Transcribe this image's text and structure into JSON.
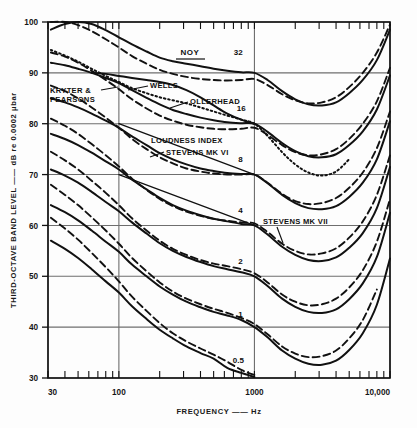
{
  "figure": {
    "background": "#fdfdfd",
    "ink": "#111111",
    "grid_color": "#6e6e6e"
  },
  "axis": {
    "y_title": "THIRD-OCTAVE BAND LEVEL —— dB re 0.0002 μbar",
    "x_title": "FREQUENCY —— Hz",
    "x_ticklabels": [
      "30",
      "100",
      "1000",
      "10,000"
    ],
    "y_ticklabels": [
      "30",
      "40",
      "50",
      "60",
      "70",
      "80",
      "90",
      "100"
    ]
  },
  "annotations": {
    "noy_header": "NOY",
    "kryter": "KRYTER &",
    "kryter2": "PEARSONS",
    "wells": "WELLS",
    "ollerhead": "OLLERHEAD",
    "loudness_index": "LOUDNESS INDEX",
    "stevens_mk6": "STEVENS MK VI",
    "stevens_mk7": "STEVENS MK VII"
  },
  "chart_data": {
    "type": "line",
    "title": "",
    "xlabel": "FREQUENCY — Hz",
    "ylabel": "THIRD-OCTAVE BAND LEVEL — dB re 0.0002 μbar",
    "xscale": "log",
    "xlim": [
      30,
      10000
    ],
    "ylim": [
      30,
      100
    ],
    "xticks": [
      30,
      100,
      1000,
      10000
    ],
    "yticks": [
      30,
      40,
      50,
      60,
      70,
      80,
      90,
      100
    ],
    "grid": true,
    "legend": "inline-annotations",
    "noy_contours": [
      32,
      16,
      8,
      4,
      2,
      1,
      0.5
    ],
    "noy_label_positions": [
      {
        "noy": "32",
        "x": 760,
        "y": 93.5
      },
      {
        "noy": "16",
        "x": 800,
        "y": 82.5
      },
      {
        "noy": "8",
        "x": 790,
        "y": 72.5
      },
      {
        "noy": "4",
        "x": 790,
        "y": 62.5
      },
      {
        "noy": "2",
        "x": 790,
        "y": 52.5
      },
      {
        "noy": "1",
        "x": 790,
        "y": 42.0
      },
      {
        "noy": "0.5",
        "x": 760,
        "y": 33.0
      }
    ],
    "series": [
      {
        "name": "Kryter & Pearsons (solid)",
        "style": "solid",
        "noy": 32,
        "x": [
          31.5,
          40,
          50,
          63,
          80,
          100,
          125,
          160,
          200,
          250,
          315,
          400,
          500,
          630,
          800,
          1000,
          1250,
          1600,
          2000,
          2500,
          3150,
          4000,
          5000,
          6300,
          8000,
          10000
        ],
        "y": [
          98.5,
          99.6,
          100,
          99.6,
          98.4,
          97.0,
          95.6,
          94.2,
          93.0,
          92.3,
          91.8,
          91.3,
          90.8,
          90.4,
          90.1,
          90.0,
          88.6,
          86.4,
          84.8,
          83.8,
          83.6,
          84.2,
          86.0,
          88.6,
          92.5,
          98.5
        ]
      },
      {
        "name": "Kryter & Pearsons (solid)",
        "style": "solid",
        "noy": 16,
        "x": [
          31.5,
          40,
          50,
          63,
          80,
          100,
          125,
          160,
          200,
          250,
          315,
          400,
          500,
          630,
          800,
          1000,
          1250,
          1600,
          2000,
          2500,
          3150,
          4000,
          5000,
          6300,
          8000,
          10000
        ],
        "y": [
          92.0,
          91.5,
          90.8,
          90.0,
          89.0,
          88.0,
          86.6,
          85.1,
          83.8,
          82.7,
          81.9,
          81.2,
          80.7,
          80.3,
          80.1,
          80.0,
          78.4,
          76.2,
          74.6,
          73.6,
          73.4,
          74.0,
          75.8,
          78.5,
          82.8,
          89.5
        ]
      },
      {
        "name": "Kryter & Pearsons (solid)",
        "style": "solid",
        "noy": 8,
        "x": [
          31.5,
          40,
          50,
          63,
          80,
          100,
          125,
          160,
          200,
          250,
          315,
          400,
          500,
          630,
          800,
          1000,
          1250,
          1600,
          2000,
          2500,
          3150,
          4000,
          5000,
          6300,
          8000,
          10000
        ],
        "y": [
          85.0,
          84.2,
          83.2,
          82.0,
          80.6,
          79.2,
          77.5,
          75.8,
          74.2,
          73.0,
          72.0,
          71.2,
          70.7,
          70.3,
          70.1,
          70.0,
          68.3,
          66.0,
          64.4,
          63.4,
          63.2,
          63.8,
          65.6,
          68.4,
          73.0,
          80.5
        ]
      },
      {
        "name": "Kryter & Pearsons (solid)",
        "style": "solid",
        "noy": 4,
        "x": [
          31.5,
          40,
          50,
          63,
          80,
          100,
          125,
          160,
          200,
          250,
          315,
          400,
          500,
          630,
          800,
          1000,
          1250,
          1600,
          2000,
          2500,
          3150,
          4000,
          5000,
          6300,
          8000,
          10000
        ],
        "y": [
          78.0,
          77.0,
          75.8,
          74.3,
          72.6,
          71.0,
          69.0,
          67.1,
          65.4,
          64.0,
          62.9,
          62.0,
          61.3,
          60.8,
          60.3,
          60.0,
          58.2,
          55.8,
          54.2,
          53.2,
          53.0,
          53.7,
          55.6,
          58.5,
          63.4,
          71.5
        ]
      },
      {
        "name": "Kryter & Pearsons (solid)",
        "style": "solid",
        "noy": 2,
        "x": [
          31.5,
          40,
          50,
          63,
          80,
          100,
          125,
          160,
          200,
          250,
          315,
          400,
          500,
          630,
          800,
          1000,
          1250,
          1600,
          2000,
          2500,
          3150,
          4000,
          5000,
          6300,
          8000,
          10000
        ],
        "y": [
          71.0,
          69.8,
          68.4,
          66.6,
          64.6,
          62.8,
          60.6,
          58.4,
          56.5,
          55.0,
          53.8,
          52.8,
          52.0,
          51.4,
          50.8,
          50.0,
          48.1,
          45.6,
          44.0,
          43.0,
          42.8,
          43.5,
          45.5,
          48.6,
          53.8,
          62.5
        ]
      },
      {
        "name": "Kryter & Pearsons (solid)",
        "style": "solid",
        "noy": 1,
        "x": [
          31.5,
          40,
          50,
          63,
          80,
          100,
          125,
          160,
          200,
          250,
          315,
          400,
          500,
          630,
          800,
          1000,
          1250,
          1600,
          2000,
          2500,
          3150,
          4000,
          5000,
          6300,
          8000,
          10000
        ],
        "y": [
          64.0,
          62.6,
          61.0,
          59.0,
          56.8,
          54.8,
          52.3,
          50.0,
          48.0,
          46.4,
          45.0,
          43.9,
          43.0,
          42.3,
          41.4,
          40.0,
          38.0,
          35.4,
          33.8,
          32.8,
          32.6,
          33.4,
          35.5,
          38.8,
          44.4,
          53.5
        ]
      },
      {
        "name": "Kryter & Pearsons (solid)",
        "style": "solid",
        "noy": 0.5,
        "x": [
          31.5,
          40,
          50,
          63,
          80,
          100,
          125,
          160,
          200,
          250,
          315,
          400,
          500,
          630,
          800,
          1000
        ],
        "y": [
          57.0,
          55.4,
          53.6,
          51.4,
          49.0,
          46.8,
          44.1,
          41.6,
          39.5,
          37.8,
          36.2,
          34.9,
          33.8,
          32.0,
          31.0,
          30.2
        ]
      },
      {
        "name": "Stevens Mk VII (dashed)",
        "style": "dashed",
        "noy": 32,
        "x": [
          31.5,
          40,
          50,
          63,
          80,
          100,
          125,
          160,
          200,
          250,
          315,
          400,
          500,
          630,
          800,
          1000,
          1250,
          1600,
          2000,
          2500,
          3150,
          4000,
          5000,
          6300,
          8000,
          10000
        ],
        "y": [
          100,
          100,
          99.4,
          98.2,
          96.6,
          95.0,
          93.3,
          91.8,
          90.6,
          89.8,
          89.2,
          88.8,
          88.6,
          88.5,
          88.6,
          88.8,
          87.6,
          85.8,
          84.6,
          84.0,
          84.2,
          85.2,
          87.2,
          90.0,
          94.0,
          99.5
        ]
      },
      {
        "name": "Stevens Mk VII (dashed)",
        "style": "dashed",
        "noy": 16,
        "x": [
          31.5,
          40,
          50,
          63,
          80,
          100,
          125,
          160,
          200,
          250,
          315,
          400,
          500,
          630,
          800,
          1000,
          1250,
          1600,
          2000,
          2500,
          3150,
          4000,
          5000,
          6300,
          8000,
          10000
        ],
        "y": [
          94.0,
          93.2,
          92.0,
          90.4,
          88.6,
          86.8,
          84.8,
          83.0,
          81.6,
          80.6,
          79.8,
          79.3,
          79.0,
          78.9,
          79.0,
          79.2,
          77.8,
          75.8,
          74.4,
          73.8,
          74.0,
          75.0,
          77.0,
          80.0,
          84.4,
          91.0
        ]
      },
      {
        "name": "Stevens Mk VII (dashed)",
        "style": "dashed",
        "noy": 8,
        "x": [
          31.5,
          40,
          50,
          63,
          80,
          100,
          125,
          160,
          200,
          250,
          315,
          400,
          500,
          630,
          800,
          1000,
          1250,
          1600,
          2000,
          2500,
          3150,
          4000,
          5000,
          6300,
          8000,
          10000
        ],
        "y": [
          87.5,
          86.4,
          85.0,
          83.2,
          81.2,
          79.2,
          77.0,
          75.0,
          73.4,
          72.2,
          71.2,
          70.6,
          70.2,
          70.0,
          70.0,
          70.0,
          68.4,
          66.2,
          64.8,
          64.2,
          64.4,
          65.4,
          67.4,
          70.4,
          75.2,
          82.4
        ]
      },
      {
        "name": "Stevens Mk VII (dashed)",
        "style": "dashed",
        "noy": 4,
        "x": [
          31.5,
          40,
          50,
          63,
          80,
          100,
          125,
          160,
          200,
          250,
          315,
          400,
          500,
          630,
          800,
          1000,
          1250,
          1600,
          2000,
          2500,
          3150,
          4000,
          5000,
          6300,
          8000,
          10000
        ],
        "y": [
          81.0,
          79.6,
          78.0,
          76.0,
          73.8,
          71.6,
          69.2,
          67.0,
          65.2,
          63.8,
          62.7,
          61.9,
          61.3,
          60.9,
          60.6,
          60.4,
          58.7,
          56.4,
          55.0,
          54.3,
          54.5,
          55.5,
          57.6,
          60.8,
          66.0,
          73.8
        ]
      },
      {
        "name": "Stevens Mk VII (dashed)",
        "style": "dashed",
        "noy": 2,
        "x": [
          31.5,
          40,
          50,
          63,
          80,
          100,
          125,
          160,
          200,
          250,
          315,
          400,
          500,
          630,
          800,
          1000,
          1250,
          1600,
          2000,
          2500,
          3150,
          4000,
          5000,
          6300,
          8000,
          10000
        ],
        "y": [
          74.5,
          72.8,
          71.0,
          68.8,
          66.4,
          64.0,
          61.4,
          59.0,
          57.0,
          55.4,
          54.2,
          53.2,
          52.5,
          52.0,
          51.4,
          50.6,
          48.8,
          46.4,
          45.0,
          44.3,
          44.5,
          45.6,
          47.8,
          51.2,
          56.8,
          65.2
        ]
      },
      {
        "name": "Stevens Mk VII (dashed)",
        "style": "dashed",
        "noy": 1,
        "x": [
          31.5,
          40,
          50,
          63,
          80,
          100,
          125,
          160,
          200,
          250,
          315,
          400,
          500,
          630,
          800,
          1000,
          1250,
          1600,
          2000,
          2500,
          3150,
          4000,
          5000,
          6300,
          8000
        ],
        "y": [
          68.0,
          66.0,
          64.0,
          61.6,
          59.0,
          56.4,
          53.6,
          51.0,
          48.8,
          47.0,
          45.6,
          44.5,
          43.6,
          42.8,
          41.8,
          40.6,
          38.6,
          36.2,
          34.8,
          34.1,
          34.3,
          35.4,
          37.8,
          41.4,
          47.4
        ]
      },
      {
        "name": "Stevens Mk VII (dashed)",
        "style": "dashed",
        "noy": 0.5,
        "x": [
          31.5,
          40,
          50,
          63,
          80,
          100,
          125,
          160,
          200,
          250,
          315,
          400,
          500,
          630,
          800,
          1000
        ],
        "y": [
          61.5,
          59.4,
          57.2,
          54.6,
          51.8,
          49.0,
          46.0,
          43.2,
          40.8,
          38.8,
          37.2,
          35.8,
          34.6,
          33.2,
          31.6,
          30.6
        ]
      },
      {
        "name": "Ollerhead (dotted)",
        "style": "dotted",
        "x": [
          31.5,
          40,
          50,
          63,
          80,
          100,
          125,
          160,
          200,
          250,
          315,
          400,
          500,
          630,
          800,
          1000,
          1250,
          1600,
          2000,
          2500,
          3150,
          4000,
          5000
        ],
        "y": [
          94.5,
          93.4,
          92.2,
          90.8,
          89.4,
          88.2,
          87.0,
          86.0,
          85.2,
          84.6,
          84.0,
          83.2,
          82.4,
          81.6,
          80.8,
          80.0,
          77.6,
          74.4,
          72.0,
          70.4,
          69.8,
          70.6,
          73.0
        ]
      },
      {
        "name": "Wells (solid segment)",
        "style": "solid",
        "x": [
          63,
          80,
          100,
          125,
          160,
          200,
          250,
          315,
          400,
          500,
          630,
          800,
          1000
        ],
        "y": [
          90.0,
          89.8,
          89.4,
          89.0,
          88.6,
          88.2,
          87.6,
          86.6,
          85.2,
          83.6,
          82.0,
          80.8,
          80.0
        ]
      },
      {
        "name": "Loudness Index / Stevens Mk VI (straight)",
        "style": "solid-thin",
        "x": [
          100,
          1000
        ],
        "y": [
          80.0,
          70.0
        ]
      },
      {
        "name": "Loudness Index / Stevens Mk VI (straight)",
        "style": "solid-thin",
        "x": [
          100,
          1000
        ],
        "y": [
          70.0,
          60.0
        ]
      }
    ]
  }
}
